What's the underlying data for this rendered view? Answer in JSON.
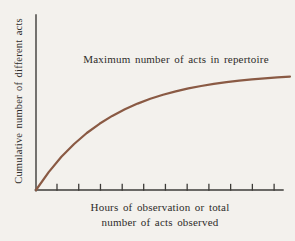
{
  "figure": {
    "background_color": "#f3f1ed",
    "annotation": "Maximum number of acts in repertoire",
    "ylabel": "Cumulative number of different acts",
    "xlabel_line1": "Hours of observation or total",
    "xlabel_line2": "number of acts observed"
  },
  "chart_data": {
    "type": "line",
    "title": "",
    "annotation": "Maximum number of acts in repertoire",
    "xlabel": "Hours of observation or total number of acts observed",
    "ylabel": "Cumulative number of different acts",
    "axis_color": "#3d3b38",
    "curve_color": "#8a5a44",
    "grid": false,
    "legend": false,
    "x_axis": {
      "tick_labels": [],
      "tick_count": 11,
      "tick_fractions": [
        0.085,
        0.173,
        0.261,
        0.349,
        0.436,
        0.524,
        0.612,
        0.7,
        0.788,
        0.876,
        0.964
      ],
      "ticks_point": "up"
    },
    "y_axis": {
      "tick_labels": [],
      "tick_count": 0
    },
    "series": [
      {
        "name": "cumulative-number-of-different-acts",
        "description": "Saturating curve rising steeply from origin and levelling off toward the maximum repertoire size",
        "x": [
          0,
          0.05,
          0.1,
          0.15,
          0.2,
          0.25,
          0.3,
          0.35,
          0.4,
          0.45,
          0.5,
          0.55,
          0.6,
          0.65,
          0.7,
          0.75,
          0.8,
          0.85,
          0.9,
          0.95,
          1.0
        ],
        "y": [
          0,
          0.152,
          0.281,
          0.39,
          0.483,
          0.561,
          0.628,
          0.684,
          0.732,
          0.773,
          0.807,
          0.836,
          0.861,
          0.881,
          0.899,
          0.914,
          0.927,
          0.938,
          0.947,
          0.954,
          0.961
        ],
        "y_asymptote": 1.0
      }
    ]
  }
}
